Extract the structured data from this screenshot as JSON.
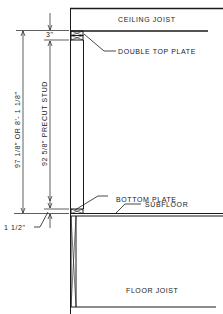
{
  "diagram": {
    "type": "wall-framing-section",
    "colors": {
      "line": "#1a1a1a",
      "background": "#ffffff"
    },
    "labels": {
      "ceiling_joist": "CEILING JOIST",
      "double_top_plate": "DOUBLE TOP PLATE",
      "top_plate_dim": "3\"",
      "overall_height": "97 1/8\" OR  8'- 1 1/8\"",
      "stud_length": "92 5/8\" PRECUT STUD",
      "bottom_plate": "BOTTOM PLATE",
      "subfloor": "SUBFLOOR",
      "bottom_plate_dim": "1 1/2\"",
      "floor_joist": "FLOOR JOIST"
    }
  }
}
